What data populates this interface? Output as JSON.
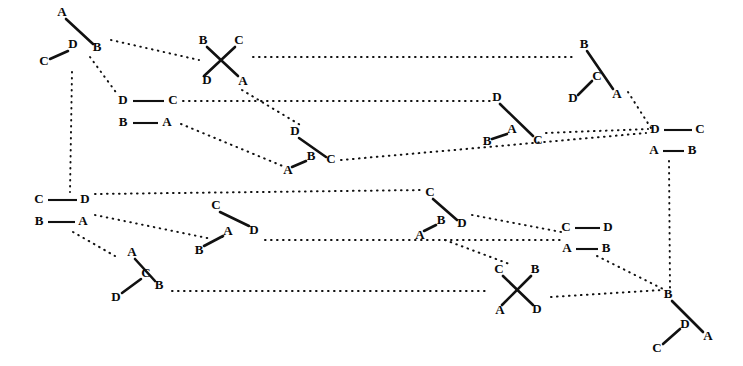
{
  "figure": {
    "background_color": "#ffffff",
    "ink_color": "#111111",
    "width": 743,
    "height": 366,
    "label_alphabet": [
      "A",
      "B",
      "C",
      "D"
    ],
    "node_count": 14,
    "link_count": 19,
    "link_style": "dotted",
    "edge_style": "solid"
  },
  "nodes": [
    {
      "id": "node-1",
      "kind": "wedge-pair",
      "center": [
        70,
        37
      ],
      "labels": [
        {
          "text": "A",
          "x": 62,
          "y": 13
        },
        {
          "text": "B",
          "x": 97,
          "y": 48
        },
        {
          "text": "D",
          "x": 73,
          "y": 45
        },
        {
          "text": "C",
          "x": 44,
          "y": 62
        }
      ],
      "edges": [
        {
          "from": [
            66,
            19
          ],
          "to": [
            93,
            44
          ]
        },
        {
          "from": [
            68,
            51
          ],
          "to": [
            50,
            59
          ]
        }
      ]
    },
    {
      "id": "node-2",
      "kind": "cross",
      "center": [
        219,
        60
      ],
      "labels": [
        {
          "text": "B",
          "x": 203,
          "y": 41
        },
        {
          "text": "C",
          "x": 239,
          "y": 41
        },
        {
          "text": "D",
          "x": 207,
          "y": 81
        },
        {
          "text": "A",
          "x": 243,
          "y": 82
        }
      ],
      "edges": [
        {
          "from": [
            207,
            47
          ],
          "to": [
            238,
            76
          ]
        },
        {
          "from": [
            235,
            47
          ],
          "to": [
            204,
            76
          ]
        }
      ]
    },
    {
      "id": "node-3",
      "kind": "h-pair",
      "center": [
        148,
        111
      ],
      "labels": [
        {
          "text": "D",
          "x": 123,
          "y": 101
        },
        {
          "text": "C",
          "x": 173,
          "y": 101
        },
        {
          "text": "B",
          "x": 123,
          "y": 123
        },
        {
          "text": "A",
          "x": 167,
          "y": 123
        }
      ],
      "edges": [
        {
          "from": [
            133,
            101
          ],
          "to": [
            164,
            101
          ]
        },
        {
          "from": [
            133,
            123
          ],
          "to": [
            158,
            123
          ]
        }
      ]
    },
    {
      "id": "node-4",
      "kind": "wedge-pair",
      "center": [
        310,
        147
      ],
      "labels": [
        {
          "text": "D",
          "x": 295,
          "y": 132
        },
        {
          "text": "C",
          "x": 331,
          "y": 160
        },
        {
          "text": "B",
          "x": 311,
          "y": 157
        },
        {
          "text": "A",
          "x": 288,
          "y": 171
        }
      ],
      "edges": [
        {
          "from": [
            299,
            138
          ],
          "to": [
            326,
            157
          ]
        },
        {
          "from": [
            306,
            161
          ],
          "to": [
            292,
            167
          ]
        }
      ]
    },
    {
      "id": "node-5",
      "kind": "wedge-pair",
      "center": [
        510,
        120
      ],
      "labels": [
        {
          "text": "D",
          "x": 497,
          "y": 98
        },
        {
          "text": "C",
          "x": 538,
          "y": 141
        },
        {
          "text": "A",
          "x": 512,
          "y": 130
        },
        {
          "text": "B",
          "x": 487,
          "y": 142
        }
      ],
      "edges": [
        {
          "from": [
            500,
            104
          ],
          "to": [
            533,
            136
          ]
        },
        {
          "from": [
            507,
            134
          ],
          "to": [
            492,
            139
          ]
        }
      ]
    },
    {
      "id": "node-6",
      "kind": "wedge-pair",
      "center": [
        598,
        72
      ],
      "labels": [
        {
          "text": "B",
          "x": 584,
          "y": 45
        },
        {
          "text": "A",
          "x": 617,
          "y": 95
        },
        {
          "text": "C",
          "x": 597,
          "y": 77
        },
        {
          "text": "D",
          "x": 573,
          "y": 99
        }
      ],
      "edges": [
        {
          "from": [
            587,
            51
          ],
          "to": [
            613,
            89
          ]
        },
        {
          "from": [
            592,
            81
          ],
          "to": [
            578,
            95
          ]
        }
      ]
    },
    {
      "id": "node-7",
      "kind": "h-pair",
      "center": [
        677,
        140
      ],
      "labels": [
        {
          "text": "D",
          "x": 655,
          "y": 130
        },
        {
          "text": "C",
          "x": 700,
          "y": 130
        },
        {
          "text": "A",
          "x": 654,
          "y": 151
        },
        {
          "text": "B",
          "x": 692,
          "y": 151
        }
      ],
      "edges": [
        {
          "from": [
            664,
            130
          ],
          "to": [
            692,
            130
          ]
        },
        {
          "from": [
            663,
            151
          ],
          "to": [
            684,
            151
          ]
        }
      ]
    },
    {
      "id": "node-8",
      "kind": "h-pair",
      "center": [
        62,
        211
      ],
      "labels": [
        {
          "text": "C",
          "x": 39,
          "y": 200
        },
        {
          "text": "D",
          "x": 85,
          "y": 200
        },
        {
          "text": "B",
          "x": 39,
          "y": 222
        },
        {
          "text": "A",
          "x": 83,
          "y": 222
        }
      ],
      "edges": [
        {
          "from": [
            48,
            200
          ],
          "to": [
            77,
            200
          ]
        },
        {
          "from": [
            48,
            222
          ],
          "to": [
            75,
            222
          ]
        }
      ]
    },
    {
      "id": "node-9",
      "kind": "wedge-pair",
      "center": [
        229,
        228
      ],
      "labels": [
        {
          "text": "C",
          "x": 216,
          "y": 206
        },
        {
          "text": "D",
          "x": 254,
          "y": 231
        },
        {
          "text": "A",
          "x": 228,
          "y": 232
        },
        {
          "text": "B",
          "x": 199,
          "y": 251
        }
      ],
      "edges": [
        {
          "from": [
            220,
            212
          ],
          "to": [
            249,
            226
          ]
        },
        {
          "from": [
            223,
            236
          ],
          "to": [
            204,
            246
          ]
        }
      ]
    },
    {
      "id": "node-10",
      "kind": "wedge-pair",
      "center": [
        143,
        277
      ],
      "labels": [
        {
          "text": "A",
          "x": 132,
          "y": 253
        },
        {
          "text": "B",
          "x": 159,
          "y": 286
        },
        {
          "text": "C",
          "x": 146,
          "y": 274
        },
        {
          "text": "D",
          "x": 116,
          "y": 298
        }
      ],
      "edges": [
        {
          "from": [
            135,
            259
          ],
          "to": [
            155,
            281
          ]
        },
        {
          "from": [
            141,
            279
          ],
          "to": [
            122,
            293
          ]
        }
      ]
    },
    {
      "id": "node-11",
      "kind": "wedge-pair",
      "center": [
        434,
        214
      ],
      "labels": [
        {
          "text": "C",
          "x": 430,
          "y": 193
        },
        {
          "text": "D",
          "x": 462,
          "y": 224
        },
        {
          "text": "B",
          "x": 441,
          "y": 221
        },
        {
          "text": "A",
          "x": 420,
          "y": 236
        }
      ],
      "edges": [
        {
          "from": [
            433,
            199
          ],
          "to": [
            457,
            220
          ]
        },
        {
          "from": [
            436,
            225
          ],
          "to": [
            424,
            231
          ]
        }
      ]
    },
    {
      "id": "node-12",
      "kind": "h-pair",
      "center": [
        586,
        238
      ],
      "labels": [
        {
          "text": "C",
          "x": 566,
          "y": 228
        },
        {
          "text": "D",
          "x": 608,
          "y": 228
        },
        {
          "text": "A",
          "x": 567,
          "y": 249
        },
        {
          "text": "B",
          "x": 606,
          "y": 249
        }
      ],
      "edges": [
        {
          "from": [
            575,
            228
          ],
          "to": [
            600,
            228
          ]
        },
        {
          "from": [
            576,
            249
          ],
          "to": [
            598,
            249
          ]
        }
      ]
    },
    {
      "id": "node-13",
      "kind": "cross",
      "center": [
        517,
        289
      ],
      "labels": [
        {
          "text": "C",
          "x": 499,
          "y": 270
        },
        {
          "text": "B",
          "x": 535,
          "y": 270
        },
        {
          "text": "A",
          "x": 500,
          "y": 311
        },
        {
          "text": "D",
          "x": 537,
          "y": 310
        }
      ],
      "edges": [
        {
          "from": [
            503,
            276
          ],
          "to": [
            533,
            305
          ]
        },
        {
          "from": [
            531,
            276
          ],
          "to": [
            502,
            305
          ]
        }
      ]
    },
    {
      "id": "node-14",
      "kind": "wedge-pair",
      "center": [
        685,
        320
      ],
      "labels": [
        {
          "text": "B",
          "x": 668,
          "y": 295
        },
        {
          "text": "A",
          "x": 708,
          "y": 337
        },
        {
          "text": "D",
          "x": 685,
          "y": 325
        },
        {
          "text": "C",
          "x": 657,
          "y": 349
        }
      ],
      "edges": [
        {
          "from": [
            672,
            301
          ],
          "to": [
            703,
            332
          ]
        },
        {
          "from": [
            680,
            329
          ],
          "to": [
            663,
            344
          ]
        }
      ]
    }
  ],
  "links": [
    {
      "id": "link-1",
      "from": "node-1",
      "to": "node-2",
      "path": "M111,40 L199,60"
    },
    {
      "id": "link-2",
      "from": "node-2",
      "to": "node-6",
      "path": "M253,57 L575,57"
    },
    {
      "id": "link-3",
      "from": "node-1",
      "to": "node-3",
      "path": "M90,57 L118,95"
    },
    {
      "id": "link-4",
      "from": "node-1",
      "to": "node-8",
      "path": "M72,72 L70,192"
    },
    {
      "id": "link-5",
      "from": "node-3",
      "to": "node-5",
      "path": "M183,101 L490,101"
    },
    {
      "id": "link-6",
      "from": "node-2",
      "to": "node-4",
      "path": "M242,90 L302,126"
    },
    {
      "id": "link-7",
      "from": "node-3",
      "to": "node-4",
      "path": "M181,124 L285,167"
    },
    {
      "id": "link-8",
      "from": "node-4",
      "to": "node-7",
      "path": "M341,160 L646,133"
    },
    {
      "id": "link-9",
      "from": "node-6",
      "to": "node-7",
      "path": "M628,92 L651,128"
    },
    {
      "id": "link-10",
      "from": "node-5",
      "to": "node-7",
      "path": "M546,133 L648,129"
    },
    {
      "id": "link-11",
      "from": "node-7",
      "to": "node-14",
      "path": "M669,161 L670,288"
    },
    {
      "id": "link-12",
      "from": "node-8",
      "to": "node-11",
      "path": "M95,194 L424,190"
    },
    {
      "id": "link-13",
      "from": "node-8",
      "to": "node-9",
      "path": "M95,215 L212,239"
    },
    {
      "id": "link-14",
      "from": "node-8",
      "to": "node-10",
      "path": "M73,232 L115,256"
    },
    {
      "id": "link-15",
      "from": "node-9",
      "to": "node-12",
      "path": "M265,240 L560,240"
    },
    {
      "id": "link-16",
      "from": "node-11",
      "to": "node-12",
      "path": "M472,215 L561,232"
    },
    {
      "id": "link-17",
      "from": "node-11",
      "to": "node-13",
      "path": "M445,240 L512,265"
    },
    {
      "id": "link-18",
      "from": "node-10",
      "to": "node-13",
      "path": "M172,291 L490,291"
    },
    {
      "id": "link-19",
      "from": "node-12",
      "to": "node-14",
      "path": "M597,256 L665,290"
    },
    {
      "id": "link-20",
      "from": "node-13",
      "to": "node-14",
      "path": "M551,297 L662,290"
    }
  ]
}
